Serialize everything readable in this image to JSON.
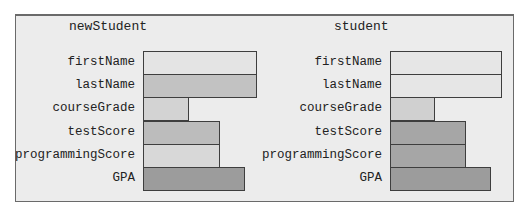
{
  "objects": [
    {
      "name": "newStudent",
      "fields": [
        {
          "label": "firstName",
          "width": 114,
          "color": "#e4e4e4"
        },
        {
          "label": "lastName",
          "width": 114,
          "color": "#c2c2c2"
        },
        {
          "label": "courseGrade",
          "width": 46,
          "color": "#d3d3d3"
        },
        {
          "label": "testScore",
          "width": 77,
          "color": "#bcbcbc"
        },
        {
          "label": "programmingScore",
          "width": 77,
          "color": "#d8d8d8"
        },
        {
          "label": "GPA",
          "width": 102,
          "color": "#9c9c9c"
        }
      ]
    },
    {
      "name": "student",
      "fields": [
        {
          "label": "firstName",
          "width": 112,
          "color": "#e6e6e6"
        },
        {
          "label": "lastName",
          "width": 112,
          "color": "#e6e6e6"
        },
        {
          "label": "courseGrade",
          "width": 45,
          "color": "#d0d0d0"
        },
        {
          "label": "testScore",
          "width": 76,
          "color": "#a6a6a6"
        },
        {
          "label": "programmingScore",
          "width": 76,
          "color": "#a6a6a6"
        },
        {
          "label": "GPA",
          "width": 101,
          "color": "#9c9c9c"
        }
      ]
    }
  ]
}
